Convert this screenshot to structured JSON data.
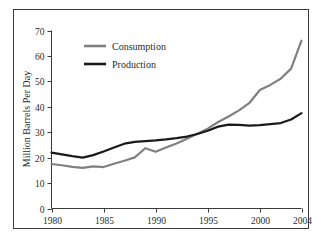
{
  "chart_data": {
    "type": "line",
    "title": "",
    "xlabel": "",
    "ylabel": "Million Barrels Per Day",
    "xlim": [
      1980,
      2004
    ],
    "ylim": [
      0,
      70
    ],
    "xticks": [
      "1980",
      "1985",
      "1990",
      "1995",
      "2000",
      "2004"
    ],
    "xtick_values": [
      1980,
      1985,
      1990,
      1995,
      2000,
      2004
    ],
    "yticks": [
      "0",
      "10",
      "20",
      "30",
      "40",
      "50",
      "60",
      "70"
    ],
    "ytick_values": [
      0,
      10,
      20,
      30,
      40,
      50,
      60,
      70
    ],
    "grid": false,
    "legend_position": "top-left",
    "x": [
      1980,
      1981,
      1982,
      1983,
      1984,
      1985,
      1986,
      1987,
      1988,
      1989,
      1990,
      1991,
      1992,
      1993,
      1994,
      1995,
      1996,
      1997,
      1998,
      1999,
      2000,
      2001,
      2002,
      2003,
      2004
    ],
    "series": [
      {
        "name": "Consumption",
        "color": "#808080",
        "values": [
          17.5,
          17.0,
          16.4,
          16.0,
          16.6,
          16.3,
          17.6,
          18.8,
          20.1,
          23.7,
          22.3,
          24.0,
          25.6,
          27.4,
          29.4,
          31.4,
          34.0,
          36.2,
          38.6,
          41.5,
          46.6,
          48.6,
          51.0,
          55.0,
          66.0
        ]
      },
      {
        "name": "Production",
        "color": "#1a1a1a",
        "values": [
          22.0,
          21.3,
          20.6,
          20.0,
          21.0,
          22.4,
          24.0,
          25.5,
          26.2,
          26.5,
          26.8,
          27.2,
          27.7,
          28.3,
          29.3,
          30.6,
          32.2,
          33.0,
          32.9,
          32.6,
          32.8,
          33.2,
          33.6,
          35.0,
          37.5
        ]
      }
    ]
  },
  "legend": {
    "items": [
      {
        "label": "Consumption",
        "color": "#808080"
      },
      {
        "label": "Production",
        "color": "#1a1a1a"
      }
    ]
  },
  "axes": {
    "y_title": "Million Barrels Per Day"
  }
}
